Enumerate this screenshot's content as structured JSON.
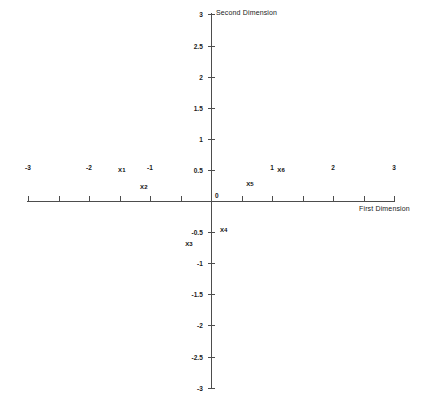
{
  "chart_data": {
    "type": "scatter",
    "title": "",
    "xlabel": "First Dimension",
    "ylabel": "Second Dimension",
    "xlim": [
      -3,
      3
    ],
    "ylim": [
      -3,
      3
    ],
    "grid": false,
    "legend": "none",
    "xticks": [
      {
        "value": -3,
        "label": "-3"
      },
      {
        "value": -2.5,
        "label": ""
      },
      {
        "value": -2,
        "label": "-2"
      },
      {
        "value": -1.5,
        "label": ""
      },
      {
        "value": -1,
        "label": "-1"
      },
      {
        "value": -0.5,
        "label": ""
      },
      {
        "value": 0,
        "label": "0"
      },
      {
        "value": 0.5,
        "label": ""
      },
      {
        "value": 1,
        "label": "1"
      },
      {
        "value": 1.5,
        "label": ""
      },
      {
        "value": 2,
        "label": "2"
      },
      {
        "value": 2.5,
        "label": ""
      },
      {
        "value": 3,
        "label": "3"
      }
    ],
    "yticks": [
      {
        "value": 3,
        "label": "3"
      },
      {
        "value": 2.5,
        "label": "2.5"
      },
      {
        "value": 2,
        "label": "2"
      },
      {
        "value": 1.5,
        "label": "1.5"
      },
      {
        "value": 1,
        "label": "1"
      },
      {
        "value": 0.5,
        "label": "0.5"
      },
      {
        "value": 0,
        "label": "0"
      },
      {
        "value": -0.5,
        "label": "-0.5"
      },
      {
        "value": -1,
        "label": "-1"
      },
      {
        "value": -1.5,
        "label": "-1.5"
      },
      {
        "value": -2,
        "label": "-2"
      },
      {
        "value": -2.5,
        "label": "-2.5"
      },
      {
        "value": -3,
        "label": "-3"
      }
    ],
    "points": [
      {
        "label": "X1",
        "x": -1.46,
        "y": 0.5
      },
      {
        "label": "X2",
        "x": -1.1,
        "y": 0.23
      },
      {
        "label": "X3",
        "x": -0.36,
        "y": -0.69
      },
      {
        "label": "X4",
        "x": 0.21,
        "y": -0.47
      },
      {
        "label": "X5",
        "x": 0.64,
        "y": 0.28
      },
      {
        "label": "X6",
        "x": 1.15,
        "y": 0.5
      }
    ]
  },
  "colors": {
    "axis": "#4d4d4d",
    "text": "#1a1a1a",
    "point_label": "#0d0d0d",
    "background": "#ffffff"
  }
}
